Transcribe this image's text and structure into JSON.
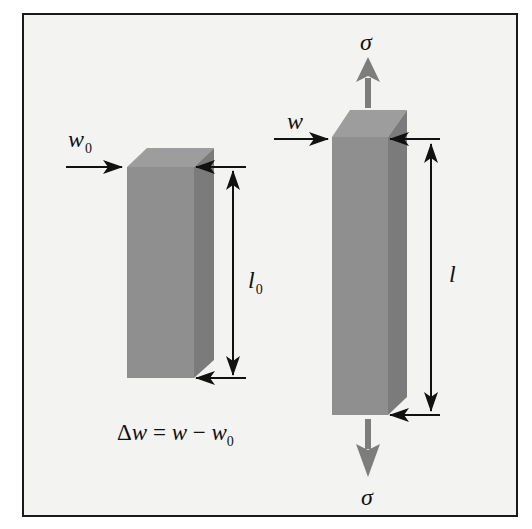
{
  "figure": {
    "left_bar": {
      "state": "unloaded",
      "width_label": {
        "symbol": "w",
        "subscript": "0"
      },
      "length_label": {
        "symbol": "l",
        "subscript": "0"
      }
    },
    "right_bar": {
      "state": "loaded",
      "width_label": {
        "symbol": "w"
      },
      "length_label": {
        "symbol": "l"
      },
      "stress_top_label": "σ",
      "stress_bottom_label": "σ"
    },
    "equation": {
      "delta": "Δ",
      "lhs_var": "w",
      "equals": " = ",
      "rhs_var1": "w",
      "minus": " − ",
      "rhs_var2": "w",
      "rhs_sub": "0"
    },
    "colors": {
      "bar_front": "#8f8f8f",
      "bar_top": "#9c9c9c",
      "bar_side": "#7a7a7a",
      "stress_arrow": "#7d7d7d",
      "dimension_line": "#111111",
      "background": "#f3f3f1",
      "frame_border": "#1a1a1a"
    }
  }
}
